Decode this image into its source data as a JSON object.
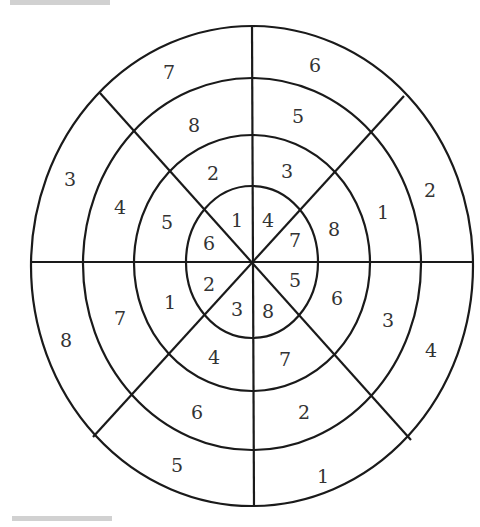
{
  "figure": {
    "type": "concentric-ring number wheel",
    "rings": 4,
    "sectors": 8,
    "center": [
      252,
      262
    ]
  },
  "cells": {
    "inner": [
      {
        "sector": "N-NW",
        "value": "1",
        "pos": [
          237,
          220
        ]
      },
      {
        "sector": "N-NE",
        "value": "4",
        "pos": [
          268,
          220
        ]
      },
      {
        "sector": "E-NE",
        "value": "7",
        "pos": [
          295,
          240
        ]
      },
      {
        "sector": "E-SE",
        "value": "5",
        "pos": [
          295,
          280
        ]
      },
      {
        "sector": "S-SE",
        "value": "8",
        "pos": [
          268,
          311
        ]
      },
      {
        "sector": "S-SW",
        "value": "3",
        "pos": [
          237,
          309
        ]
      },
      {
        "sector": "W-SW",
        "value": "2",
        "pos": [
          209,
          284
        ]
      },
      {
        "sector": "W-NW",
        "value": "6",
        "pos": [
          209,
          243
        ]
      }
    ],
    "ring2": [
      {
        "sector": "N-NW",
        "value": "2",
        "pos": [
          213,
          173
        ]
      },
      {
        "sector": "N-NE",
        "value": "3",
        "pos": [
          287,
          171
        ]
      },
      {
        "sector": "E-NE",
        "value": "8",
        "pos": [
          334,
          229
        ]
      },
      {
        "sector": "E-SE",
        "value": "6",
        "pos": [
          337,
          298
        ]
      },
      {
        "sector": "S-SE",
        "value": "7",
        "pos": [
          285,
          359
        ]
      },
      {
        "sector": "S-SW",
        "value": "4",
        "pos": [
          214,
          357
        ]
      },
      {
        "sector": "W-SW",
        "value": "1",
        "pos": [
          170,
          302
        ]
      },
      {
        "sector": "W-NW",
        "value": "5",
        "pos": [
          167,
          222
        ]
      }
    ],
    "ring3": [
      {
        "sector": "N-NW",
        "value": "8",
        "pos": [
          194,
          125
        ]
      },
      {
        "sector": "N-NE",
        "value": "5",
        "pos": [
          298,
          116
        ]
      },
      {
        "sector": "E-NE",
        "value": "1",
        "pos": [
          383,
          212
        ]
      },
      {
        "sector": "E-SE",
        "value": "3",
        "pos": [
          388,
          320
        ]
      },
      {
        "sector": "S-SE",
        "value": "2",
        "pos": [
          304,
          412
        ]
      },
      {
        "sector": "S-SW",
        "value": "6",
        "pos": [
          197,
          412
        ]
      },
      {
        "sector": "W-SW",
        "value": "7",
        "pos": [
          120,
          318
        ]
      },
      {
        "sector": "W-NW",
        "value": "4",
        "pos": [
          120,
          207
        ]
      }
    ],
    "outer": [
      {
        "sector": "N-NW",
        "value": "7",
        "pos": [
          169,
          72
        ]
      },
      {
        "sector": "N-NE",
        "value": "6",
        "pos": [
          315,
          65
        ]
      },
      {
        "sector": "E-NE",
        "value": "2",
        "pos": [
          430,
          190
        ]
      },
      {
        "sector": "E-SE",
        "value": "4",
        "pos": [
          431,
          350
        ]
      },
      {
        "sector": "S-SE",
        "value": "1",
        "pos": [
          323,
          476
        ]
      },
      {
        "sector": "S-SW",
        "value": "5",
        "pos": [
          177,
          465
        ]
      },
      {
        "sector": "W-SW",
        "value": "8",
        "pos": [
          66,
          340
        ]
      },
      {
        "sector": "W-NW",
        "value": "3",
        "pos": [
          70,
          179
        ]
      }
    ]
  },
  "colors": {
    "line": "#1a1a1a",
    "text": "#333333",
    "background": "#ffffff"
  }
}
